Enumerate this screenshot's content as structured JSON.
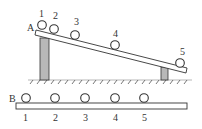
{
  "diagram": {
    "incline": {
      "end_label": "A",
      "ball_labels": [
        "1",
        "2",
        "3",
        "4",
        "5"
      ],
      "ball_positions": [
        {
          "cx": 42,
          "cy": 25
        },
        {
          "cx": 54,
          "cy": 29
        },
        {
          "cx": 75,
          "cy": 35
        },
        {
          "cx": 115,
          "cy": 45
        },
        {
          "cx": 180,
          "cy": 63
        }
      ]
    },
    "horizontal": {
      "end_label": "B",
      "ball_labels": [
        "1",
        "2",
        "3",
        "4",
        "5"
      ],
      "ball_positions": [
        {
          "cx": 26,
          "cy": 98
        },
        {
          "cx": 55,
          "cy": 98
        },
        {
          "cx": 85,
          "cy": 98
        },
        {
          "cx": 115,
          "cy": 98
        },
        {
          "cx": 144,
          "cy": 98
        }
      ]
    },
    "colors": {
      "line": "#333333",
      "support_fill": "#b8b8b8",
      "background": "#ffffff"
    }
  }
}
